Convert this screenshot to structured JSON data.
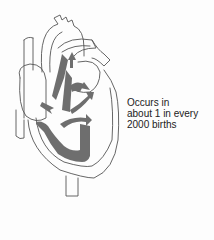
{
  "caption": {
    "lines": [
      "Occurs in",
      "about 1 in every",
      "2000 births"
    ]
  },
  "colors": {
    "outline": "#555555",
    "fill_gray": "#6e6e6e",
    "background": "#fdfdfd"
  },
  "diagram": {
    "arrows_count": 5
  }
}
